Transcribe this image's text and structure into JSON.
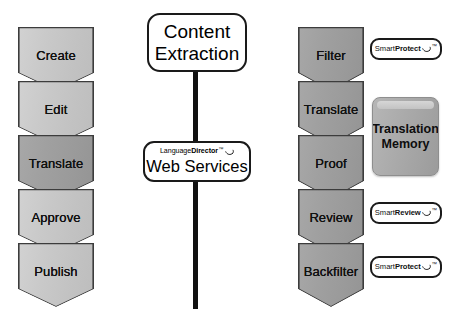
{
  "diagram": {
    "background_color": "#ffffff"
  },
  "colors": {
    "chevron_light": "#c9c9c9",
    "chevron_dark": "#a0a0a0",
    "outline": "#1a1a1a",
    "translation_memory_fill": "#a8a8a8",
    "text": "#111111"
  },
  "authoring_workflow": {
    "name": "Authoring workflow",
    "steps": [
      {
        "label": "Create",
        "tone": "light"
      },
      {
        "label": "Edit",
        "tone": "light"
      },
      {
        "label": "Translate",
        "tone": "dark"
      },
      {
        "label": "Approve",
        "tone": "light"
      },
      {
        "label": "Publish",
        "tone": "light"
      }
    ]
  },
  "translation_workflow": {
    "name": "Translation workflow",
    "steps": [
      {
        "label": "Filter",
        "tone": "dark"
      },
      {
        "label": "Translate",
        "tone": "dark"
      },
      {
        "label": "Proof",
        "tone": "dark"
      },
      {
        "label": "Review",
        "tone": "dark"
      },
      {
        "label": "Backfilter",
        "tone": "dark"
      }
    ]
  },
  "center": {
    "content_extraction": {
      "line1": "Content",
      "line2": "Extraction"
    },
    "web_services": {
      "logo_regular": "Language",
      "logo_bold": "Director",
      "logo_trademark": "™",
      "logo_swoosh": "swoosh-mark",
      "title": "Web Services"
    },
    "connector": "vertical-dashed-line"
  },
  "products": [
    {
      "id": "smartprotect-top",
      "regular": "Smart",
      "bold": "Protect",
      "trademark": "™",
      "swoosh": "swoosh-mark"
    },
    {
      "id": "smartreview",
      "regular": "Smart",
      "bold": "Review",
      "trademark": "™",
      "swoosh": "swoosh-mark"
    },
    {
      "id": "smartprotect-bottom",
      "regular": "Smart",
      "bold": "Protect",
      "trademark": "™",
      "swoosh": "swoosh-mark"
    }
  ],
  "translation_memory": {
    "line1": "Translation",
    "line2": "Memory"
  }
}
